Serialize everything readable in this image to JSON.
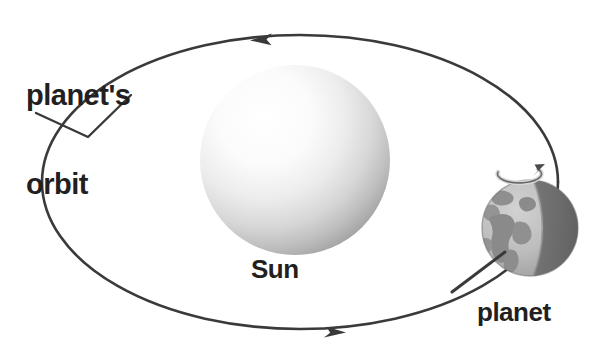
{
  "diagram": {
    "title_text": "planet's orbit",
    "type": "astronomy-orbit-diagram",
    "background_color": "#ffffff",
    "line_color": "#3a3a3a"
  },
  "labels": {
    "orbit": "planet's\norbit",
    "orbit_line1": "planet's",
    "orbit_line2": "orbit",
    "sun": "Sun",
    "planet": "planet"
  },
  "sun": {
    "name": "Sun",
    "center_x": 295,
    "center_y": 160,
    "radius": 95,
    "highlight_color": "#ffffff",
    "shade_color": "#8d8d8d"
  },
  "planet": {
    "name": "planet",
    "center_x": 530,
    "center_y": 228,
    "radius": 48,
    "lit_color": "#b9b9b9",
    "shadow_color": "#6b6b6b",
    "land_color": "#9a9a9a",
    "rotation_arrow": "rotation-arrow"
  },
  "orbit": {
    "name": "planet's orbit",
    "center_x": 300,
    "center_y": 182,
    "radius_x": 258,
    "radius_y": 147,
    "direction_top": "left",
    "direction_bottom": "right",
    "arrow_top_x": 262,
    "arrow_top_y": 37,
    "arrow_bottom_x": 336,
    "arrow_bottom_y": 336
  },
  "leader_line": {
    "name": "orbit-leader-line",
    "from_x": 36,
    "from_y": 113,
    "elbow_x": 88,
    "elbow_y": 137,
    "to_x": 130,
    "to_y": 96
  }
}
